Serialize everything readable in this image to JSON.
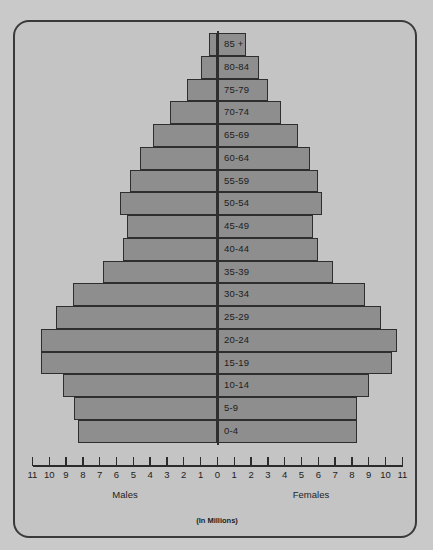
{
  "chart_data": {
    "type": "bar",
    "title": "",
    "subtitle": "",
    "orientation": "horizontal-diverging",
    "xlabel": "(In Millions)",
    "ylabel": "",
    "units_note": "(In Millions)",
    "left_group_label": "Males",
    "right_group_label": "Females",
    "xlim": [
      -11,
      11
    ],
    "xtick_values": [
      -11,
      -10,
      -9,
      -8,
      -7,
      -6,
      -5,
      -4,
      -3,
      -2,
      -1,
      0,
      1,
      2,
      3,
      4,
      5,
      6,
      7,
      8,
      9,
      10,
      11
    ],
    "xtick_labels": [
      "11",
      "10",
      "9",
      "8",
      "7",
      "6",
      "5",
      "4",
      "3",
      "2",
      "1",
      "0",
      "1",
      "2",
      "3",
      "4",
      "5",
      "6",
      "7",
      "8",
      "9",
      "10",
      "11"
    ],
    "grid": false,
    "legend": "none",
    "bar_fill_color": "#8e8e8e",
    "bar_border_color": "#2e2e2e",
    "background_color": "#c4c4c4",
    "categories": [
      "85 +",
      "80-84",
      "75-79",
      "70-74",
      "65-69",
      "60-64",
      "55-59",
      "50-54",
      "45-49",
      "40-44",
      "35-39",
      "30-34",
      "25-29",
      "20-24",
      "15-19",
      "10-14",
      "5-9",
      "0-4"
    ],
    "series": [
      {
        "name": "Males",
        "side": "left",
        "values": [
          0.5,
          1.0,
          1.8,
          2.8,
          3.8,
          4.6,
          5.2,
          5.8,
          5.4,
          5.6,
          6.8,
          8.6,
          9.6,
          10.5,
          10.5,
          9.2,
          8.5,
          8.3
        ]
      },
      {
        "name": "Females",
        "side": "right",
        "values": [
          1.7,
          2.5,
          3.0,
          3.8,
          4.8,
          5.5,
          6.0,
          6.2,
          5.7,
          6.0,
          6.9,
          8.8,
          9.7,
          10.7,
          10.4,
          9.0,
          8.3,
          8.3
        ]
      }
    ]
  }
}
